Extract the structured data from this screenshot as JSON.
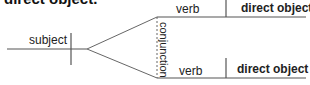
{
  "title": "direct object.",
  "diagram": {
    "subject_label": "subject",
    "conjunction_label": "conjunction",
    "branches": [
      {
        "verb_label": "verb",
        "object_label": "direct object"
      },
      {
        "verb_label": "verb",
        "object_label": "direct object"
      }
    ],
    "line_color": "#555555"
  }
}
